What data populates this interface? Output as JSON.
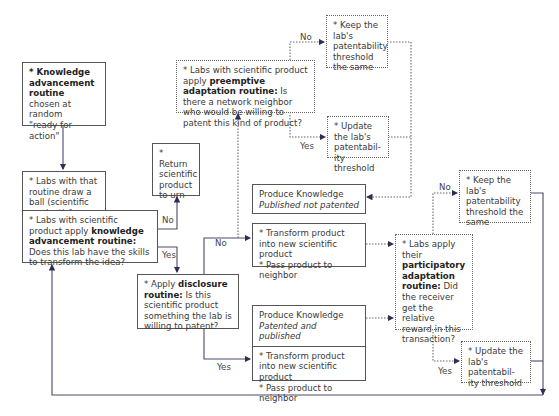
{
  "diagram": {
    "type": "flowchart",
    "colors": {
      "line": "#3d3d5c",
      "box_border": "#555555",
      "text": "#3a3a3a"
    },
    "nodes": {
      "start": {
        "bold": "* Knowledge advancement routine",
        "rest1": "chosen at random",
        "rest2": "\"ready for action\""
      },
      "draw_ball": {
        "text": "* Labs with that routine draw a ball (scientific product) from the urn"
      },
      "knowledge_q": {
        "pre": "* Labs with scientific product apply ",
        "bold": "knowledge advancement routine:",
        "post": " Does this lab have the skills to transform the idea?"
      },
      "return_urn": {
        "text": "* Return scientific product to urn"
      },
      "disclosure": {
        "pre": "* Apply ",
        "bold": "disclosure routine:",
        "post": " Is this scientific product something the lab is willing to patent?"
      },
      "preemptive": {
        "pre": "* Labs with scientific product apply ",
        "bold": "preemptive adaptation routine:",
        "post": " Is there a network neighbor who would be willing to patent this kind of product?"
      },
      "keep_top": {
        "text": "* Keep the lab's patentability threshold the same"
      },
      "update_top": {
        "text": "* Update the lab's patentabil-ity threshold"
      },
      "published_not_patented": {
        "title": "Produce Knowledge",
        "subtitle": "Published not patented"
      },
      "transform_top": {
        "line1": "* Transform product into new scientific product",
        "line2": "* Pass product to neighbor"
      },
      "participatory": {
        "pre": "* Labs apply their ",
        "bold": "participatory adaptation routine:",
        "post": " Did the receiver get the relative reward in this transaction?"
      },
      "keep_right": {
        "text": "* Keep the lab's patentability threshold the same"
      },
      "patented_published": {
        "title": "Produce Knowledge",
        "subtitle": "Patented and published",
        "line1": "* Transform product into new scientific product",
        "line2": "* Pass product to neighbor"
      },
      "update_right": {
        "text": "* Update the lab's patentabil-ity threshold"
      }
    },
    "edge_labels": {
      "kq_no": "No",
      "kq_yes": "Yes",
      "disc_no": "No",
      "disc_yes": "Yes",
      "pre_no": "No",
      "pre_yes": "Yes",
      "part_no": "No",
      "part_yes": "Yes"
    }
  }
}
